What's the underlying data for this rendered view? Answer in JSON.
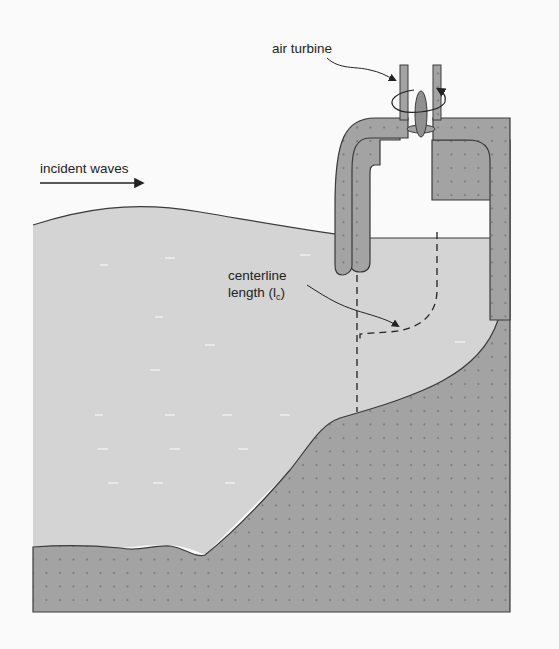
{
  "figure": {
    "colors": {
      "background": "#fafafa",
      "water": "#d4d4d4",
      "structure": "#a3a3a3",
      "outline": "#3a3a3a",
      "dot": "#6e6e6e"
    }
  },
  "labels": {
    "air_turbine": "air turbine",
    "incident_waves": "incident waves",
    "centerline_line1": "centerline",
    "centerline_line2_prefix": "length (l",
    "centerline_subscript": "c",
    "centerline_line2_suffix": ")"
  },
  "components": [
    {
      "name": "air-turbine",
      "type": "rotor"
    },
    {
      "name": "chamber-wall",
      "type": "structure"
    },
    {
      "name": "seabed",
      "type": "terrain"
    },
    {
      "name": "water-body",
      "type": "fluid"
    },
    {
      "name": "centerline-path",
      "type": "dashed-line"
    },
    {
      "name": "wave-direction-arrow",
      "type": "arrow"
    }
  ]
}
